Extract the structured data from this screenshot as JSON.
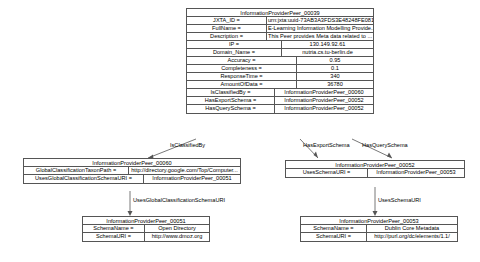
{
  "diagram": {
    "nodes": {
      "main": {
        "title": "InformationProviderPeer_00039",
        "rows": [
          {
            "key": "JXTA_ID =",
            "value": "urn:jxta:uuid-73AB3A3FDS3E48248FE08133CD..."
          },
          {
            "key": "FullName =",
            "value": "E-Learning Information Modelling Provide..."
          },
          {
            "key": "Description =",
            "value": "This Peer provides Meta data related to ..."
          },
          {
            "key": "IP =",
            "value": "130.149.92.61"
          },
          {
            "key": "Domain_Name =",
            "value": "nutria.cs.tu-berlin.de"
          },
          {
            "key": "Accuracy =",
            "value": "0.95"
          },
          {
            "key": "Completeness =",
            "value": "0.1"
          },
          {
            "key": "ResponseTime =",
            "value": "340"
          },
          {
            "key": "AmountOfData =",
            "value": "36780"
          },
          {
            "key": "IsClassifiedBy =",
            "value": "InformationProviderPeer_00060"
          },
          {
            "key": "HasExportSchema =",
            "value": "InformationProviderPeer_00052"
          },
          {
            "key": "HasQuerySchema =",
            "value": "InformationProviderPeer_00052"
          }
        ]
      },
      "classification": {
        "title": "InformationProviderPeer_00060",
        "rows": [
          {
            "key": "GlobalClassificationTaxonPath =",
            "value": "http://directory.google.com/Top/Computer..."
          },
          {
            "key": "UsesGlobalClassificationSchemaURI =",
            "value": "InformationProviderPeer_00051"
          }
        ]
      },
      "schema": {
        "title": "InformationProviderPeer_00052",
        "rows": [
          {
            "key": "UsesSchemaURI =",
            "value": "InformationProviderPeer_00053"
          }
        ]
      },
      "dmoz": {
        "title": "InformationProviderPeer_00051",
        "rows": [
          {
            "key": "SchemaName =",
            "value": "Open Directory"
          },
          {
            "key": "SchemaURI =",
            "value": "http://www.dmoz.org"
          }
        ]
      },
      "dublincore": {
        "title": "InformationProviderPeer_00053",
        "rows": [
          {
            "key": "SchemaName =",
            "value": "Dublin Core Metadata"
          },
          {
            "key": "SchemaURI =",
            "value": "http://purl.org/dc/elements/1.1/"
          }
        ]
      }
    },
    "edges": {
      "is_classified_by": "IsClassifiedBy",
      "has_export_schema": "HasExportSchema",
      "has_query_schema": "HasQuerySchema",
      "uses_global_classification_schema_uri": "UsesGlobalClassificationSchemaURI",
      "uses_schema_uri": "UsesSchemaURI"
    },
    "colors": {
      "border": "#555555",
      "text": "#000000",
      "background": "#ffffff"
    }
  }
}
